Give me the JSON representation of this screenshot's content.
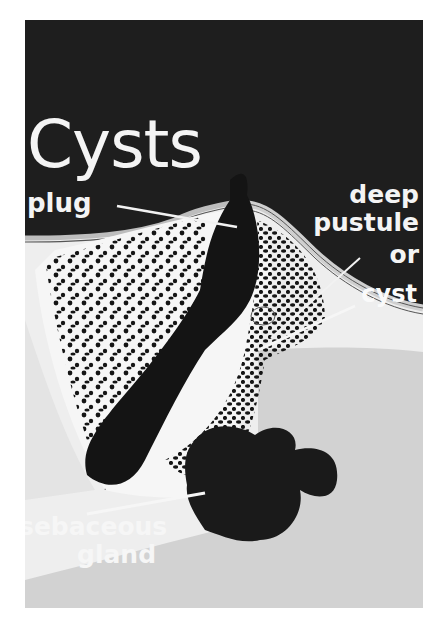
{
  "figure": {
    "title": "Cysts",
    "labels": {
      "plug": "plug",
      "deep": "deep",
      "pustule": "pustule",
      "or": "or",
      "cyst": "cyst",
      "sebaceous": "sebaceous",
      "gland": "gland"
    },
    "colors": {
      "background_top": "#1e1e1e",
      "skin_light": "#f0f0f0",
      "dermis_gray": "#cfcfcf",
      "follicle_dark": "#141414",
      "label_text": "#f4f4f4"
    }
  }
}
